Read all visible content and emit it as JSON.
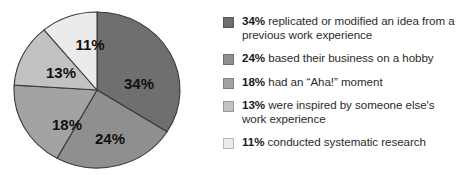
{
  "chart_data": {
    "type": "pie",
    "title": "",
    "categories": [
      "replicated or modified an idea from a previous work experience",
      "based their business on a hobby",
      "had an \"Aha!\" moment",
      "were inspired by someone else's work experience",
      "conducted systematic research"
    ],
    "values": [
      34,
      24,
      18,
      13,
      11
    ],
    "value_labels": [
      "34%",
      "24%",
      "18%",
      "13%",
      "11%"
    ],
    "colors": [
      "#6f6f6f",
      "#8f8f8f",
      "#a3a3a3",
      "#c2c2c2",
      "#ebebeb"
    ],
    "start_angle_deg": 0,
    "direction": "clockwise",
    "legend_position": "right",
    "grid": false,
    "xlabel": "",
    "ylabel": ""
  },
  "pie": {
    "slices": [
      {
        "label": "34%",
        "value": 34,
        "color": "#6f6f6f",
        "label_x": 126,
        "label_y": 74
      },
      {
        "label": "24%",
        "value": 24,
        "color": "#8f8f8f",
        "label_x": 97,
        "label_y": 129
      },
      {
        "label": "18%",
        "value": 18,
        "color": "#a3a3a3",
        "label_x": 54,
        "label_y": 115
      },
      {
        "label": "13%",
        "value": 13,
        "color": "#c2c2c2",
        "label_x": 48,
        "label_y": 63
      },
      {
        "label": "11%",
        "value": 11,
        "color": "#ebebeb",
        "label_x": 77,
        "label_y": 35
      }
    ],
    "outline_color": "#3a3a3a"
  },
  "legend": {
    "items": [
      {
        "swatch_color": "#6f6f6f",
        "percent": "34%",
        "description": " replicated or modified an idea from a previous work experience"
      },
      {
        "swatch_color": "#8f8f8f",
        "percent": "24%",
        "description": " based their business on a hobby"
      },
      {
        "swatch_color": "#a3a3a3",
        "percent": "18%",
        "description": " had an “Aha!” moment"
      },
      {
        "swatch_color": "#c2c2c2",
        "percent": "13%",
        "description": " were inspired by someone else's work experience"
      },
      {
        "swatch_color": "#ebebeb",
        "percent": "11%",
        "description": " conducted systematic research"
      }
    ]
  }
}
